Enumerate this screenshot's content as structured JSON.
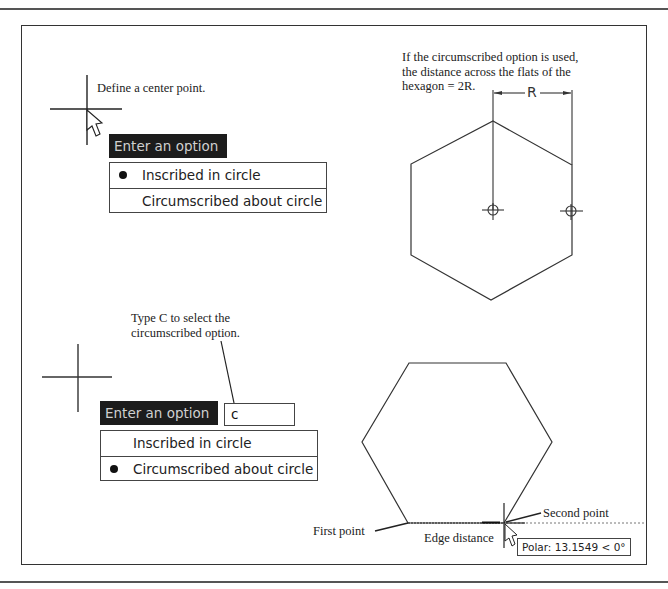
{
  "figure": {
    "top_left": {
      "note": "Define a center point.",
      "prompt_label": "Enter an option",
      "options": [
        {
          "label": "Inscribed in circle",
          "selected": true
        },
        {
          "label": "Circumscribed about circle",
          "selected": false
        }
      ]
    },
    "top_right": {
      "note_lines": [
        "If the circumscribed option is used,",
        "the distance across the flats of the",
        "hexagon = 2R."
      ],
      "dimension_label": "R"
    },
    "bottom_left": {
      "note_lines": [
        "Type C to select the",
        "circumscribed option."
      ],
      "prompt_label": "Enter an option",
      "input_value": "c",
      "options": [
        {
          "label": "Inscribed in circle",
          "selected": false
        },
        {
          "label": "Circumscribed about circle",
          "selected": true
        }
      ]
    },
    "bottom_right": {
      "first_point_label": "First point",
      "second_point_label": "Second point",
      "edge_distance_label": "Edge distance",
      "polar_tooltip": "Polar: 13.1549 < 0°"
    }
  }
}
